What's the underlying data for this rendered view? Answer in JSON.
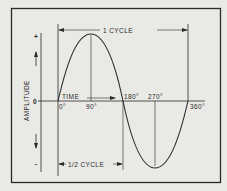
{
  "diagram": {
    "colors": {
      "background": "#e9e9e6",
      "ink": "#2a2a2a"
    },
    "y_axis": {
      "label": "AMPLITUDE",
      "plus": "+",
      "zero": "0",
      "minus": "-"
    },
    "x_axis": {
      "label": "TIME",
      "ticks": [
        "0°",
        "90°",
        "180°",
        "270°",
        "360°"
      ]
    },
    "annotations": {
      "full_cycle": "1 CYCLE",
      "half_cycle": "1/2 CYCLE"
    }
  }
}
